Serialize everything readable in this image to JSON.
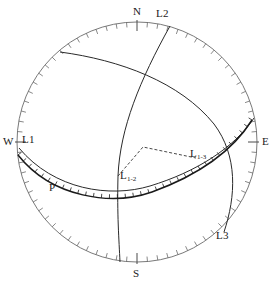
{
  "figure": {
    "type": "stereonet",
    "projection": "equal-angle lower hemisphere",
    "background_color": "#ffffff",
    "line_color": "#1a1a1a",
    "primitive_circle_color": "#555555",
    "center": {
      "x": 137,
      "y": 142
    },
    "radius": 120
  },
  "cardinal_labels": [
    {
      "id": "north",
      "text": "N",
      "x": 133,
      "y": 6
    },
    {
      "id": "south",
      "text": "S",
      "x": 133,
      "y": 268
    },
    {
      "id": "east",
      "text": "E",
      "x": 262,
      "y": 136
    },
    {
      "id": "west",
      "text": "W",
      "x": 3,
      "y": 136
    }
  ],
  "lineation_labels": [
    {
      "id": "l1",
      "text": "L1",
      "x": 22,
      "y": 134
    },
    {
      "id": "l2",
      "text": "L2",
      "x": 156,
      "y": 8
    },
    {
      "id": "l3",
      "text": "L3",
      "x": 216,
      "y": 230
    }
  ],
  "plane_labels": [
    {
      "id": "p",
      "text": "P",
      "x": 49,
      "y": 182
    }
  ],
  "intersection_labels": [
    {
      "id": "l1-2",
      "base": "L",
      "sub": "1-2",
      "x": 120,
      "y": 170
    },
    {
      "id": "l1-3",
      "base": "L",
      "sub": "1-3",
      "x": 190,
      "y": 148
    }
  ],
  "chart_data": {
    "type": "scatter",
    "title": "",
    "primitive_circle": {
      "cx": 137,
      "cy": 142,
      "r": 120
    },
    "tick_marks": {
      "count": 72,
      "interval_degrees": 5,
      "length_px": 5,
      "description": "graduated rim ticks around primitive circle"
    },
    "cardinal_ticks": {
      "length_px": 9,
      "azimuths": [
        0,
        90,
        180,
        270
      ]
    },
    "great_circles": [
      {
        "name": "P",
        "style": "solid-hatched",
        "hatch_side": "upper",
        "hatch_count": 34,
        "hatch_length_px": 4,
        "description": "gently dipping plane P, hatched great circle arc from west rim through south-center to east rim",
        "path": "M 18 155 C 52 198, 112 206, 152 192 C 196 176, 232 152, 252 120"
      },
      {
        "name": "L1-plane",
        "style": "solid",
        "description": "plane containing lineation L1, arc from W rim to E rim below P",
        "path": "M 19 148 C 54 190, 110 198, 150 186 C 196 172, 234 148, 254 118"
      },
      {
        "name": "L2-plane",
        "style": "solid",
        "description": "steeply dipping plane, near-vertical arc from N rim to S rim",
        "path": "M 170 26 C 140 80, 120 128, 118 176 C 117 214, 119 240, 120 262"
      },
      {
        "name": "L3-plane",
        "style": "solid",
        "description": "plane arc from NW rim sweeping east then south to SE rim",
        "path": "M 60 52 C 120 60, 180 82, 214 124 C 238 156, 236 196, 224 232"
      }
    ],
    "dashed_construction": {
      "style": "dashed",
      "dash_pattern": "3 2",
      "vertices": [
        {
          "x": 118,
          "y": 176
        },
        {
          "x": 143,
          "y": 147
        },
        {
          "x": 196,
          "y": 158
        }
      ],
      "description": "dashed construction connecting L1-2 to apex to L1-3"
    },
    "points": [
      {
        "label": "L1-2",
        "x": 118,
        "y": 176,
        "description": "intersection of plane 1 and plane 2"
      },
      {
        "label": "L1-3",
        "x": 196,
        "y": 158,
        "description": "intersection of plane 1 and plane 3"
      }
    ]
  }
}
